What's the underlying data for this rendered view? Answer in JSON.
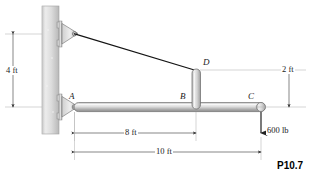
{
  "figure": {
    "caption": "P10.7",
    "points": {
      "a": "A",
      "b": "B",
      "c": "C",
      "d": "D"
    },
    "dimensions": {
      "height_wall": "4 ft",
      "span_ab": "8 ft",
      "span_ac": "10 ft",
      "post_height": "2 ft"
    },
    "load": {
      "value": "600 lb"
    },
    "colors": {
      "wall_light": "#e8e8e8",
      "wall_dark": "#bdbdbd",
      "beam_light": "#f2f2f2",
      "beam_dark": "#9a9a9a",
      "line": "#1a1a1a",
      "dim_line": "#555555"
    }
  }
}
